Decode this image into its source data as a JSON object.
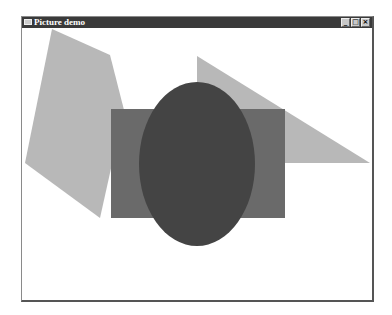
{
  "window": {
    "title": "Picture demo",
    "controls": {
      "minimize": "_",
      "maximize": "□",
      "close": "×"
    }
  },
  "canvas": {
    "shapes": [
      {
        "type": "polygon",
        "name": "light-gray-pentagon",
        "points": "52,29 110,55 124,110 100,218 25,163",
        "fill": "#b8b8b8"
      },
      {
        "type": "polygon",
        "name": "light-gray-triangle",
        "points": "197,56 370,163 197,163",
        "fill": "#b8b8b8"
      },
      {
        "type": "rect",
        "name": "medium-gray-rectangle",
        "x": 111,
        "y": 109,
        "w": 174,
        "h": 109,
        "fill": "#6a6a6a"
      },
      {
        "type": "ellipse",
        "name": "dark-gray-ellipse",
        "cx": 197,
        "cy": 164,
        "rx": 58,
        "ry": 82,
        "fill": "#444444"
      }
    ]
  }
}
